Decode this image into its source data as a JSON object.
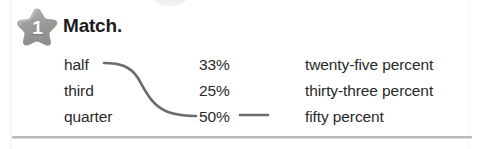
{
  "exercise": {
    "number": "1",
    "badge_icon": "star-badge-icon",
    "instruction": "Match."
  },
  "colors": {
    "badge_fill": "#9a9a9a",
    "badge_number": "#ffffff",
    "text": "#2a2a2a",
    "heading": "#1d1d1d",
    "connector_line": "#6b6b6b",
    "bottom_rule": "#b9b9b9"
  },
  "columns": {
    "fractions": [
      {
        "label": "half"
      },
      {
        "label": "third"
      },
      {
        "label": "quarter"
      }
    ],
    "percents": [
      {
        "label": "33%"
      },
      {
        "label": "25%"
      },
      {
        "label": "50%"
      }
    ],
    "words": [
      {
        "label": "twenty-five percent"
      },
      {
        "label": "thirty-three percent"
      },
      {
        "label": "fifty percent"
      }
    ]
  },
  "connections": [
    {
      "from": "half",
      "to": "50%",
      "style": "s-curve"
    },
    {
      "from": "50%",
      "to": "fifty percent",
      "style": "short-dash"
    }
  ]
}
